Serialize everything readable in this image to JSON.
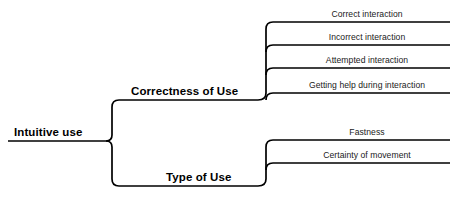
{
  "diagram": {
    "type": "mind-map",
    "orientation": "left-to-right",
    "background_color": "#ffffff",
    "line_color": "#000000",
    "text_color": "#000000",
    "root": {
      "label": "Intuitive use",
      "bold": true
    },
    "branches": [
      {
        "label": "Correctness of Use",
        "bold": true,
        "children": [
          {
            "label": "Correct interaction"
          },
          {
            "label": "Incorrect interaction"
          },
          {
            "label": "Attempted interaction"
          },
          {
            "label": "Getting help during interaction"
          }
        ]
      },
      {
        "label": "Type of Use",
        "bold": true,
        "children": [
          {
            "label": "Fastness"
          },
          {
            "label": "Certainty of movement"
          }
        ]
      }
    ]
  },
  "geometry": {
    "root_label_left": 14,
    "root_label_baseline": 138,
    "branch1_label_left": 131,
    "branch1_label_baseline": 97,
    "branch2_label_left": 166,
    "branch2_label_baseline": 183,
    "leaf_label_centers": [
      {
        "cx": 367,
        "baseline": 19
      },
      {
        "cx": 367,
        "baseline": 42
      },
      {
        "cx": 367,
        "baseline": 65
      },
      {
        "cx": 367,
        "baseline": 90
      },
      {
        "cx": 367,
        "baseline": 137
      },
      {
        "cx": 367,
        "baseline": 160
      }
    ]
  }
}
